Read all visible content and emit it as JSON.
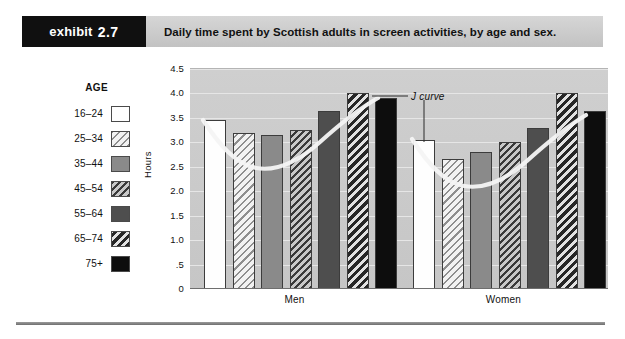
{
  "header": {
    "badge_word": "exhibit",
    "badge_number": "2.7",
    "title": "Daily time spent by Scottish adults in screen activities, by age and sex."
  },
  "legend": {
    "title": "AGE",
    "items": [
      {
        "label": "16–24",
        "swatch": "white"
      },
      {
        "label": "25–34",
        "swatch": "hatch-light"
      },
      {
        "label": "35–44",
        "swatch": "gray"
      },
      {
        "label": "45–54",
        "swatch": "hatch-dark"
      },
      {
        "label": "55–64",
        "swatch": "darkgray"
      },
      {
        "label": "65–74",
        "swatch": "hatch-bold"
      },
      {
        "label": "75+",
        "swatch": "black"
      }
    ]
  },
  "annotations": {
    "j_curve_label": "J curve"
  },
  "chart_data": {
    "type": "bar",
    "title": "Daily time spent by Scottish adults in screen activities, by age and sex.",
    "xlabel": "",
    "ylabel": "Hours",
    "categories": [
      "Men",
      "Women"
    ],
    "group_labels": [
      "Men",
      "Women"
    ],
    "series": [
      {
        "name": "16–24",
        "values": [
          3.45,
          3.05
        ]
      },
      {
        "name": "25–34",
        "values": [
          3.2,
          2.65
        ]
      },
      {
        "name": "35–44",
        "values": [
          3.15,
          2.8
        ]
      },
      {
        "name": "45–54",
        "values": [
          3.25,
          3.0
        ]
      },
      {
        "name": "55–64",
        "values": [
          3.65,
          3.3
        ]
      },
      {
        "name": "65–74",
        "values": [
          4.0,
          4.0
        ]
      },
      {
        "name": "75+",
        "values": [
          3.9,
          3.65
        ]
      }
    ],
    "ylim": [
      0,
      4.5
    ],
    "yticks": [
      0,
      0.5,
      1.0,
      1.5,
      2.0,
      2.5,
      3.0,
      3.5,
      4.0,
      4.5
    ],
    "ytick_labels": [
      "0",
      ".5",
      "1.0",
      "1.5",
      "2.0",
      "2.5",
      "3.0",
      "3.5",
      "4.0",
      "4.5"
    ],
    "grid": true,
    "legend_position": "left",
    "annotation": "J curve",
    "colors": {
      "plot_background": "#cacaca",
      "gridline": "#e6e6e6",
      "curve": "#f2f2f2",
      "bar_outline": "#3c3c3c",
      "badge_background": "#101010",
      "header_band": "#cdcdcd"
    }
  }
}
